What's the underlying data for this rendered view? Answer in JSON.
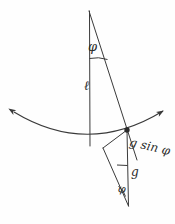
{
  "figure": {
    "background_color": "#fefefe",
    "stroke_color": "#3a3a3a",
    "labels": {
      "phi_top": "φ",
      "length": "ℓ",
      "g_sin_phi": "g sin φ",
      "g": "g",
      "phi_bottom": "φ"
    },
    "geometry": {
      "pivot": [
        89,
        11
      ],
      "bob": [
        127,
        130
      ],
      "vertical_rod_bottom": [
        90,
        146
      ],
      "force_triangle_left": [
        103,
        148
      ],
      "force_triangle_bottom": [
        128,
        205
      ],
      "arc_left_arrow": [
        12,
        113
      ],
      "arc_right_arrow": [
        165,
        112
      ]
    }
  }
}
